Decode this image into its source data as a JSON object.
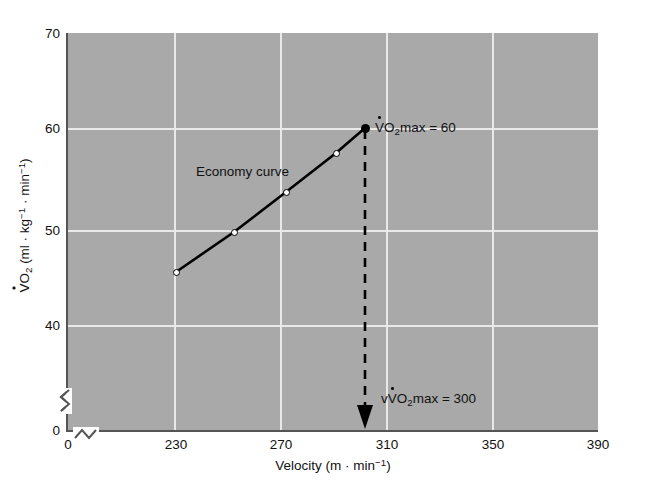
{
  "chart_data": {
    "type": "line",
    "title": "",
    "xlabel": "Velocity (m · min⁻¹)",
    "ylabel": "V̇O₂ (ml · kg⁻¹ · min⁻¹)",
    "xlim": [
      230,
      390
    ],
    "ylim": [
      33.5,
      70
    ],
    "x_ticks": [
      0,
      230,
      270,
      310,
      350,
      390
    ],
    "y_ticks": [
      0,
      40,
      50,
      60,
      70
    ],
    "x_tick_labels": [
      "0",
      "230",
      "270",
      "310",
      "350",
      "390"
    ],
    "y_tick_labels": [
      "0",
      "40",
      "50",
      "60",
      "70"
    ],
    "grid": true,
    "axis_break_x": true,
    "axis_break_y": true,
    "legend": "none",
    "series": [
      {
        "name": "Economy curve",
        "x": [
          230,
          250,
          270,
          289,
          300
        ],
        "values": [
          45.6,
          49.8,
          53.9,
          57.5,
          60.0
        ],
        "marker": "open-circle",
        "endpoint_marker": "filled-circle",
        "line_color": "#000000"
      }
    ],
    "annotations": [
      {
        "id": "economy-curve",
        "text": "Economy curve",
        "x": 252,
        "y": 55.8
      },
      {
        "id": "vo2max",
        "text": "V̇O₂max = 60",
        "x": 303,
        "y": 60
      },
      {
        "id": "vvo2max",
        "text": "vV̇O₂max = 300",
        "x": 304,
        "y": 36.8
      }
    ],
    "reference_lines": [
      {
        "id": "vvo2max-dropline",
        "orientation": "vertical",
        "x": 300,
        "from_y": 60,
        "to_y": 33.8,
        "style": "dashed",
        "arrow": "down"
      }
    ],
    "plot_background": "#a9a9a9",
    "grid_color": "#e9e9e9"
  },
  "labels": {
    "x_title_text": "Velocity (m · min",
    "x_title_sup": "−1",
    "x_title_tail": ")",
    "y_title_v": "V",
    "y_title_o": "O",
    "y_title_sub2": "2",
    "y_title_units_a": " (ml · kg",
    "y_title_sup_a": "−1",
    "y_title_units_b": " · min",
    "y_title_sup_b": "−1",
    "y_title_tail": ")",
    "economy_curve": "Economy curve",
    "vo2max_v": "V",
    "vo2max_o": "O",
    "vo2max_sub": "2",
    "vo2max_tail": "max = 60",
    "vvo2max_lead": "v",
    "vvo2max_v": "V",
    "vvo2max_o": "O",
    "vvo2max_sub": "2",
    "vvo2max_tail": "max = 300"
  },
  "ticks": {
    "x": [
      "0",
      "230",
      "270",
      "310",
      "350",
      "390"
    ],
    "y": [
      "70",
      "60",
      "50",
      "40",
      "0"
    ]
  }
}
